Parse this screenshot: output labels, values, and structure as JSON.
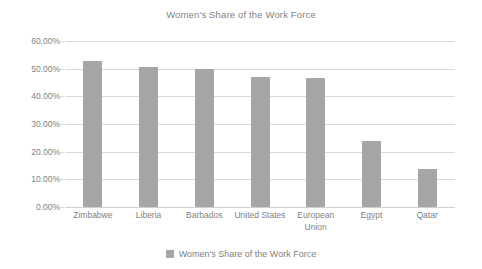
{
  "chart_data": {
    "type": "bar",
    "title": "Women's Share of the Work Force",
    "xlabel": "",
    "ylabel": "",
    "ylim": [
      0,
      60
    ],
    "grid": true,
    "legend_position": "bottom",
    "y_ticks": [
      "0.00%",
      "10.00%",
      "20.00%",
      "30.00%",
      "40.00%",
      "50.00%",
      "60.00%"
    ],
    "y_tick_values": [
      0,
      10,
      20,
      30,
      40,
      50,
      60
    ],
    "categories": [
      "Zimbabwe",
      "Liberia",
      "Barbados",
      "United States",
      "European Union",
      "Egypt",
      "Qatar"
    ],
    "category_lines": [
      [
        "Zimbabwe"
      ],
      [
        "Liberia"
      ],
      [
        "Barbados"
      ],
      [
        "United States"
      ],
      [
        "European",
        "Union"
      ],
      [
        "Egypt"
      ],
      [
        "Qatar"
      ]
    ],
    "series": [
      {
        "name": "Women's Share of the Work Force",
        "values": [
          52.8,
          50.7,
          49.8,
          47.0,
          46.7,
          23.8,
          13.7
        ],
        "color": "#a6a6a6"
      }
    ],
    "legend": [
      {
        "label": "Women's Share of the Work Force",
        "color": "#a6a6a6"
      }
    ]
  },
  "colors": {
    "bar": "#a6a6a6",
    "grid": "#d9d9d9",
    "text": "#7f7f7f",
    "background": "#ffffff"
  }
}
